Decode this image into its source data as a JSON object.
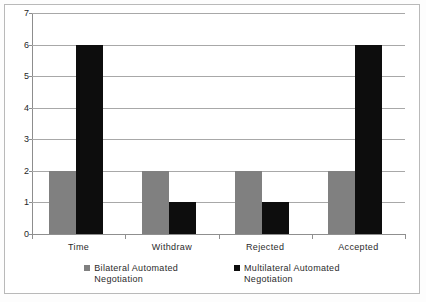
{
  "chart_data": {
    "type": "bar",
    "title": "",
    "subtitle": "",
    "xlabel": "",
    "ylabel": "",
    "categories": [
      "Time",
      "Withdraw",
      "Rejected",
      "Accepted"
    ],
    "series": [
      {
        "name": "Bilateral Automated Negotiation",
        "color": "#808080",
        "values": [
          2,
          2,
          2,
          2
        ]
      },
      {
        "name": "Multilateral Automated Negotiation",
        "color": "#0d0d0d",
        "values": [
          6,
          1,
          1,
          6
        ]
      }
    ],
    "ylim": [
      0,
      7
    ],
    "ytick_labels": [
      "0",
      "1",
      "2",
      "3",
      "4",
      "5",
      "6",
      "7"
    ],
    "ytick_values": [
      0,
      1,
      2,
      3,
      4,
      5,
      6,
      7
    ],
    "grid": true,
    "grid_axis": "y",
    "legend_position": "bottom",
    "legend": [
      {
        "swatch": "gray-square",
        "line1": "Bilateral Automated",
        "line2": "Negotiation"
      },
      {
        "swatch": "black-square",
        "line1": "Multilateral Automated",
        "line2": "Negotiation"
      }
    ]
  },
  "colors": {
    "series_bilateral": "#808080",
    "series_multilateral": "#0d0d0d",
    "gridline": "#a8a8a8",
    "axis": "#8d8d8d",
    "border": "#b9b9b9",
    "background": "#ffffff",
    "text": "#2b2b2b"
  }
}
